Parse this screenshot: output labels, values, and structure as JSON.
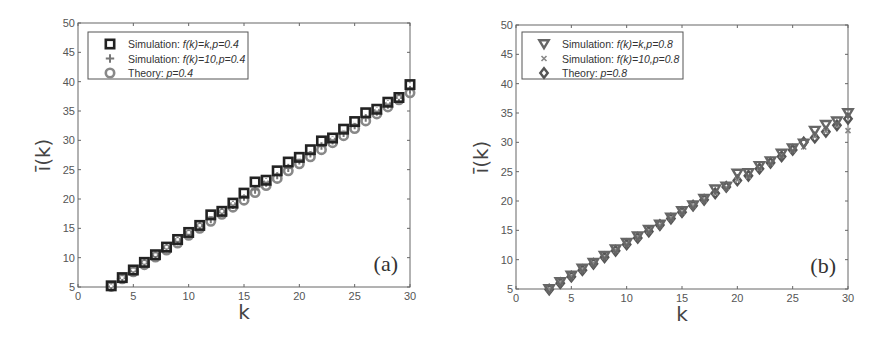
{
  "chart_data": [
    {
      "type": "scatter",
      "panel_label": "(a)",
      "xlabel": "k",
      "ylabel": "ī(k)",
      "xlim": [
        0,
        30
      ],
      "ylim": [
        5,
        50
      ],
      "xticks": [
        0,
        5,
        10,
        15,
        20,
        25,
        30
      ],
      "yticks": [
        5,
        10,
        15,
        20,
        25,
        30,
        35,
        40,
        45,
        50
      ],
      "grid": false,
      "legend_position": "upper left",
      "x": [
        3,
        4,
        5,
        6,
        7,
        8,
        9,
        10,
        11,
        12,
        13,
        14,
        15,
        16,
        17,
        18,
        19,
        20,
        21,
        22,
        23,
        24,
        25,
        26,
        27,
        28,
        29,
        30
      ],
      "series": [
        {
          "name": "Simulation: f(k)=k,p=0.4",
          "legend_prefix": "Simulation:",
          "legend_italic": "f(k)=k,p=0.4",
          "marker": "square",
          "color": "#222222",
          "values": [
            5.2,
            6.6,
            7.9,
            9.2,
            10.5,
            11.8,
            13.1,
            14.3,
            15.5,
            17.3,
            17.9,
            19.3,
            21.0,
            22.9,
            23.2,
            24.8,
            26.3,
            27.1,
            28.4,
            29.9,
            30.4,
            31.9,
            33.2,
            34.7,
            35.3,
            36.5,
            37.3,
            39.5
          ]
        },
        {
          "name": "Simulation: f(k)=10,p=0.4",
          "legend_prefix": "Simulation:",
          "legend_italic": "f(k)=10,p=0.4",
          "marker": "plus",
          "color": "#777777",
          "values": [
            5.1,
            6.5,
            7.7,
            9.0,
            10.3,
            11.6,
            12.8,
            14.0,
            15.3,
            16.6,
            17.7,
            19.0,
            20.4,
            21.6,
            22.8,
            24.1,
            25.3,
            26.6,
            27.8,
            29.1,
            30.0,
            31.3,
            32.6,
            33.9,
            34.9,
            36.1,
            37.2,
            38.7
          ]
        },
        {
          "name": "Theory: p=0.4",
          "legend_prefix": "Theory:",
          "legend_italic": "p=0.4",
          "marker": "circle",
          "color": "#888888",
          "values": [
            5.1,
            6.4,
            7.6,
            8.8,
            10.1,
            11.3,
            12.5,
            13.8,
            15.0,
            16.2,
            17.4,
            18.6,
            19.8,
            21.1,
            22.3,
            23.5,
            24.8,
            26.0,
            27.2,
            28.4,
            29.6,
            30.8,
            32.0,
            33.3,
            34.5,
            35.7,
            36.9,
            38.1
          ]
        }
      ]
    },
    {
      "type": "scatter",
      "panel_label": "(b)",
      "xlabel": "k",
      "ylabel": "ī(k)",
      "xlim": [
        0,
        30
      ],
      "ylim": [
        5,
        50
      ],
      "xticks": [
        0,
        5,
        10,
        15,
        20,
        25,
        30
      ],
      "yticks": [
        5,
        10,
        15,
        20,
        25,
        30,
        35,
        40,
        45,
        50
      ],
      "grid": false,
      "legend_position": "upper left",
      "x": [
        3,
        4,
        5,
        6,
        7,
        8,
        9,
        10,
        11,
        12,
        13,
        14,
        15,
        16,
        17,
        18,
        19,
        20,
        21,
        22,
        23,
        24,
        25,
        26,
        27,
        28,
        29,
        30
      ],
      "series": [
        {
          "name": "Simulation: f(k)=k,p=0.8",
          "legend_prefix": "Simulation:",
          "legend_italic": "f(k)=k,p=0.8",
          "marker": "triangle-down",
          "color": "#666666",
          "values": [
            5.0,
            6.2,
            7.3,
            8.5,
            9.5,
            10.7,
            11.8,
            12.9,
            14.0,
            15.1,
            16.0,
            17.2,
            18.3,
            19.3,
            20.4,
            22.0,
            22.5,
            24.7,
            24.8,
            26.0,
            26.8,
            28.1,
            29.0,
            29.8,
            32.0,
            33.0,
            33.6,
            35.0
          ]
        },
        {
          "name": "Simulation: f(k)=10,p=0.8",
          "legend_prefix": "Simulation:",
          "legend_italic": "f(k)=10,p=0.8",
          "marker": "x",
          "color": "#888888",
          "values": [
            5.0,
            6.1,
            7.2,
            8.3,
            9.4,
            10.5,
            11.6,
            12.7,
            13.8,
            14.9,
            15.9,
            17.1,
            18.1,
            19.2,
            20.2,
            21.4,
            22.3,
            23.6,
            24.2,
            25.6,
            26.5,
            27.8,
            28.7,
            29.2,
            31.0,
            31.9,
            33.0,
            32.0
          ]
        },
        {
          "name": "Theory: p=0.8",
          "legend_prefix": "Theory:",
          "legend_italic": "p=0.8",
          "marker": "diamond",
          "color": "#555555",
          "values": [
            4.9,
            6.0,
            7.1,
            8.2,
            9.3,
            10.4,
            11.5,
            12.6,
            13.7,
            14.8,
            15.9,
            17.0,
            18.1,
            19.2,
            20.2,
            21.3,
            22.4,
            23.5,
            24.3,
            25.5,
            26.5,
            27.6,
            28.7,
            30.0,
            30.8,
            31.8,
            32.9,
            34.0
          ]
        }
      ]
    }
  ]
}
